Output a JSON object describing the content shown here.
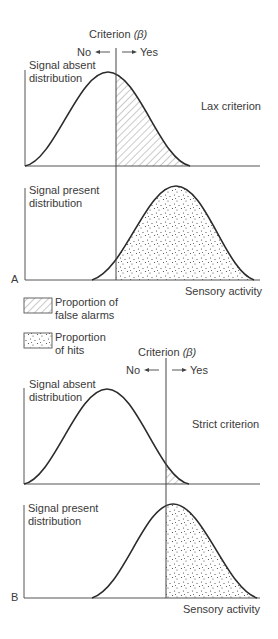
{
  "panel_a": {
    "letter": "A",
    "criterion_label": "Criterion",
    "criterion_symbol": "(β)",
    "no_label": "No",
    "yes_label": "Yes",
    "absent_label_line1": "Signal absent",
    "absent_label_line2": "distribution",
    "present_label_line1": "Signal present",
    "present_label_line2": "distribution",
    "condition_label": "Lax criterion",
    "x_axis_label": "Sensory activity"
  },
  "legend": {
    "false_alarms_line1": "Proportion of",
    "false_alarms_line2": "false alarms",
    "hits_line1": "Proportion",
    "hits_line2": "of hits"
  },
  "panel_b": {
    "letter": "B",
    "criterion_label": "Criterion",
    "criterion_symbol": "(β)",
    "no_label": "No",
    "yes_label": "Yes",
    "absent_label_line1": "Signal absent",
    "absent_label_line2": "distribution",
    "present_label_line1": "Signal present",
    "present_label_line2": "distribution",
    "condition_label": "Strict criterion",
    "x_axis_label": "Sensory activity"
  },
  "colors": {
    "line": "#2b2b2b",
    "axis": "#555555",
    "hatch": "#8a8a8a",
    "dots": "#444444",
    "text": "#3a3a3a"
  }
}
